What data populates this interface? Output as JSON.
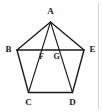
{
  "figure": {
    "type": "geometry-diagram",
    "shape": "regular-pentagon-with-diagonals",
    "width": 102,
    "height": 112,
    "background_color": "#ffffff",
    "stroke_color": "#1a1a1a",
    "frame_color": "#d8d8d8"
  },
  "vertices": [
    {
      "id": "A",
      "label": "A",
      "x": 50.5,
      "y": 22.0,
      "label_x": 50.5,
      "label_y": 11.5,
      "role": "apex"
    },
    {
      "id": "B",
      "label": "B",
      "x": 17.0,
      "y": 50.0,
      "label_x": 8.5,
      "label_y": 50.0,
      "role": "upper-left"
    },
    {
      "id": "C",
      "label": "C",
      "x": 28.5,
      "y": 92.5,
      "label_x": 28.5,
      "label_y": 103.0,
      "role": "lower-left"
    },
    {
      "id": "D",
      "label": "D",
      "x": 72.5,
      "y": 92.5,
      "label_x": 72.5,
      "label_y": 103.0,
      "role": "lower-right"
    },
    {
      "id": "E",
      "label": "E",
      "x": 84.0,
      "y": 50.0,
      "label_x": 92.5,
      "label_y": 50.0,
      "role": "upper-right"
    }
  ],
  "intersection_points": [
    {
      "id": "F",
      "label": "F",
      "x": 41.0,
      "y": 50.0,
      "label_x": 41.5,
      "label_y": 57.0,
      "on": "BE x AC"
    },
    {
      "id": "G",
      "label": "G",
      "x": 57.5,
      "y": 50.0,
      "label_x": 56.5,
      "label_y": 57.0,
      "on": "BE x AD"
    }
  ],
  "edges": [
    {
      "id": "AB",
      "from": "A",
      "to": "B",
      "kind": "side"
    },
    {
      "id": "BC",
      "from": "B",
      "to": "C",
      "kind": "side"
    },
    {
      "id": "CD",
      "from": "C",
      "to": "D",
      "kind": "side"
    },
    {
      "id": "DE",
      "from": "D",
      "to": "E",
      "kind": "side"
    },
    {
      "id": "EA",
      "from": "E",
      "to": "A",
      "kind": "side"
    }
  ],
  "diagonals": [
    {
      "id": "BE",
      "from": "B",
      "to": "E",
      "kind": "diagonal"
    },
    {
      "id": "AC",
      "from": "A",
      "to": "C",
      "kind": "diagonal"
    },
    {
      "id": "AD",
      "from": "A",
      "to": "D",
      "kind": "diagonal"
    }
  ],
  "frame": {
    "visible": true,
    "right_edge_x": 98.5,
    "left_edge_x": 2.5,
    "top_edge_y": 2.5,
    "bottom_edge_y": 109.5
  }
}
